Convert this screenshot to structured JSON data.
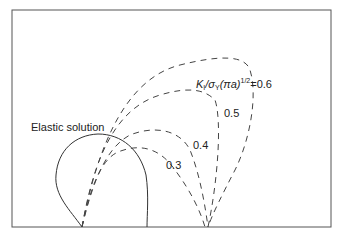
{
  "figure": {
    "elastic_label": "Elastic solution",
    "param_label_prefix": "K",
    "param_label_sub1": "I",
    "param_label_mid": "/σ",
    "param_label_sub2": "Y",
    "param_label_paren": "(πa)",
    "param_label_sup": "1/2",
    "param_label_eq": "=0.6",
    "curves": [
      {
        "label": "0.3",
        "style": "dashed"
      },
      {
        "label": "0.4",
        "style": "dashed"
      },
      {
        "label": "0.5",
        "style": "dashed"
      },
      {
        "label": "0.6",
        "style": "dashed"
      }
    ],
    "line_color": "#333333",
    "frame_color": "#555555"
  }
}
